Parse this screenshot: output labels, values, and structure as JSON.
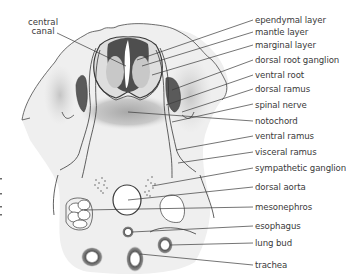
{
  "figure": {
    "type": "anatomical cross-section diagram",
    "left_labels": [
      {
        "id": "central-canal",
        "line1": "central",
        "line2": "canal"
      }
    ],
    "right_labels": [
      {
        "id": "ependymal-layer",
        "text": "ependymal layer"
      },
      {
        "id": "mantle-layer",
        "text": "mantle layer"
      },
      {
        "id": "marginal-layer",
        "text": "marginal layer"
      },
      {
        "id": "dorsal-root-ganglion",
        "text": "dorsal root ganglion"
      },
      {
        "id": "ventral-root",
        "text": "ventral root"
      },
      {
        "id": "dorsal-ramus",
        "text": "dorsal ramus"
      },
      {
        "id": "spinal-nerve",
        "text": "spinal nerve"
      },
      {
        "id": "notochord",
        "text": "notochord"
      },
      {
        "id": "ventral-ramus",
        "text": "ventral ramus"
      },
      {
        "id": "visceral-ramus",
        "text": "visceral ramus"
      },
      {
        "id": "sympathetic-ganglion",
        "text": "sympathetic ganglion"
      },
      {
        "id": "dorsal-aorta",
        "text": "dorsal aorta"
      },
      {
        "id": "mesonephros",
        "text": "mesonephros"
      },
      {
        "id": "esophagus",
        "text": "esophagus"
      },
      {
        "id": "lung-bud",
        "text": "lung bud"
      },
      {
        "id": "trachea",
        "text": "trachea"
      }
    ],
    "colors": {
      "ink": "#3a3a3a",
      "dark_tissue": "#5a5a5a",
      "mid_tissue": "#b8b8b8",
      "light_tissue": "#e6e6e6",
      "background": "#ffffff"
    }
  }
}
